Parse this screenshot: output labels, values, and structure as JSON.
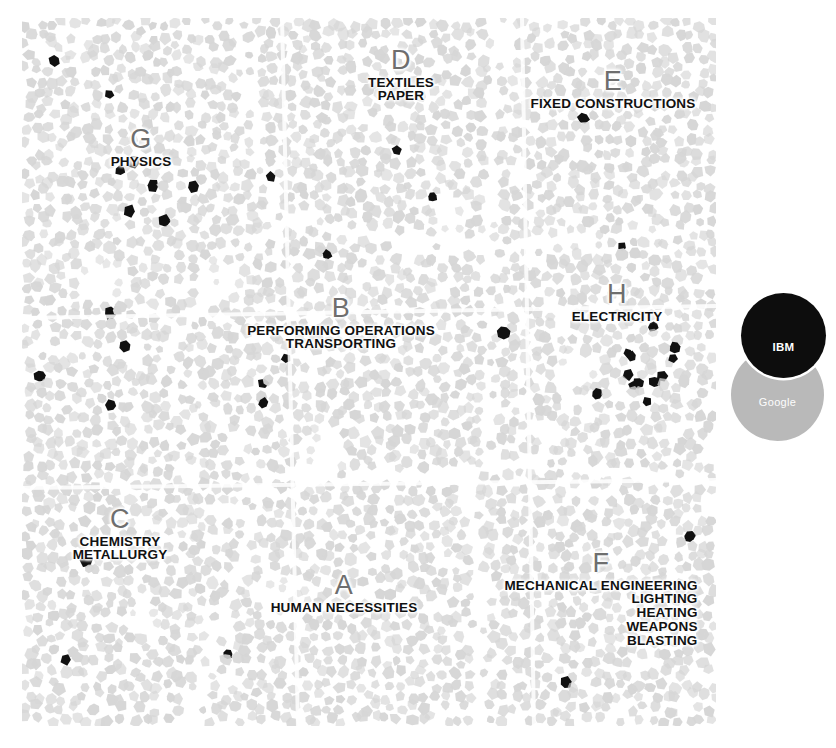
{
  "map": {
    "title": "IPC Patent Landscape Map",
    "background_color": "#ffffff",
    "cell_color": "#d6d6d6",
    "cell_highlight_color": "#111111",
    "seam_color": "#ffffff",
    "sections": [
      {
        "letter": "A",
        "lines": [
          "HUMAN NECESSITIES"
        ]
      },
      {
        "letter": "B",
        "lines": [
          "PERFORMING OPERATIONS",
          "TRANSPORTING"
        ]
      },
      {
        "letter": "C",
        "lines": [
          "CHEMISTRY",
          "METALLURGY"
        ]
      },
      {
        "letter": "D",
        "lines": [
          "TEXTILES",
          "PAPER"
        ]
      },
      {
        "letter": "E",
        "lines": [
          "FIXED CONSTRUCTIONS"
        ]
      },
      {
        "letter": "F",
        "lines": [
          "MECHANICAL ENGINEERING",
          "LIGHTING",
          "HEATING",
          "WEAPONS",
          "BLASTING"
        ]
      },
      {
        "letter": "G",
        "lines": [
          "PHYSICS"
        ]
      },
      {
        "letter": "H",
        "lines": [
          "ELECTRICITY"
        ]
      }
    ]
  },
  "legend": {
    "items": [
      {
        "label": "IBM",
        "color": "#0d0d0d",
        "text_color": "#ffffff"
      },
      {
        "label": "Google",
        "color": "#b9b9b9",
        "text_color": "#ffffff"
      }
    ]
  },
  "chart_data": {
    "type": "heatmap",
    "xlabel": "",
    "ylabel": "",
    "grid": false,
    "legend_position": "right",
    "categories": [
      "A HUMAN NECESSITIES",
      "B PERFORMING OPERATIONS TRANSPORTING",
      "C CHEMISTRY METALLURGY",
      "D TEXTILES PAPER",
      "E FIXED CONSTRUCTIONS",
      "F MECHANICAL ENGINEERING LIGHTING HEATING WEAPONS BLASTING",
      "G PHYSICS",
      "H ELECTRICITY"
    ],
    "series": [
      {
        "name": "IBM",
        "color": "#0d0d0d",
        "values": [
          4,
          12,
          6,
          1,
          1,
          3,
          14,
          13
        ]
      },
      {
        "name": "Google",
        "color": "#b9b9b9",
        "values": [
          0,
          0,
          0,
          0,
          0,
          0,
          0,
          0
        ]
      }
    ]
  }
}
